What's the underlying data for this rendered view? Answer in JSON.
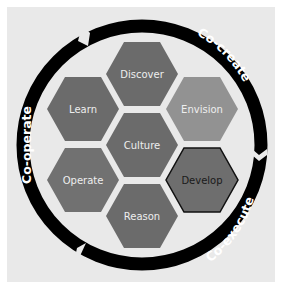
{
  "diagram": {
    "ring_segments": [
      {
        "id": "co-create",
        "label": "Co-create"
      },
      {
        "id": "co-execute",
        "label": "Co-execute"
      },
      {
        "id": "co-operate",
        "label": "Co-operate"
      }
    ],
    "hexagons": [
      {
        "id": "discover",
        "label": "Discover",
        "color": "#6b6b6b"
      },
      {
        "id": "learn",
        "label": "Learn",
        "color": "#6b6b6b"
      },
      {
        "id": "envision",
        "label": "Envision",
        "color": "#929292"
      },
      {
        "id": "culture",
        "label": "Culture",
        "color": "#6b6b6b"
      },
      {
        "id": "operate",
        "label": "Operate",
        "color": "#717171"
      },
      {
        "id": "develop",
        "label": "Develop",
        "color": "#6e6e6e",
        "outlined": true
      },
      {
        "id": "reason",
        "label": "Reason",
        "color": "#6b6b6b"
      }
    ],
    "colors": {
      "ring": "#000000",
      "background": "#e9e9e9",
      "hex_text": "#eeeeee",
      "develop_text": "#1a1a1a"
    }
  }
}
